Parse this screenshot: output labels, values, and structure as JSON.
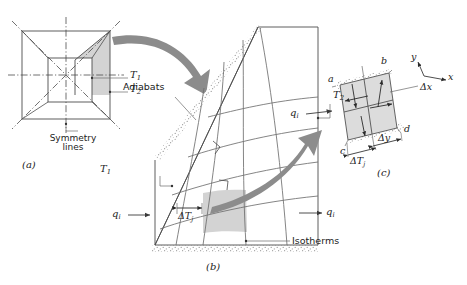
{
  "figure": {
    "kind": "heat-transfer-flux-plot",
    "panels": [
      {
        "id": "a",
        "caption": "(a)",
        "description": "Square channel cross section with symmetry lines and shaded symmetrical element"
      },
      {
        "id": "b",
        "caption": "(b)",
        "description": "Flux plot of symmetrical element showing adiabats and isotherms"
      },
      {
        "id": "c",
        "caption": "(c)",
        "description": "Typical curvilinear square with coordinate axes"
      }
    ]
  },
  "panel_a": {
    "caption": "(a)",
    "symmetry_label": {
      "line1": "Symmetry",
      "line2": "lines"
    },
    "temp_inner": "T",
    "temp_inner_sub": "1",
    "temp_outer": "T",
    "temp_outer_sub": "2"
  },
  "panel_b": {
    "caption": "(b)",
    "adiabats_label": "Adiabats",
    "isotherms_label": "Isotherms",
    "temp_hot": "T",
    "temp_hot_sub": "1",
    "temp_cold": "T",
    "temp_cold_sub": "2",
    "flux_left": "q",
    "flux_left_sub": "i",
    "flux_right": "q",
    "flux_right_sub": "i",
    "delta_t": "ΔT",
    "delta_t_sub": "j"
  },
  "panel_c": {
    "caption": "(c)",
    "corner_a": "a",
    "corner_b": "b",
    "corner_c": "c",
    "corner_d": "d",
    "axis_x": "x",
    "axis_y": "y",
    "delta_x": "Δx",
    "delta_y": "Δy",
    "delta_t": "ΔT",
    "delta_t_sub": "j",
    "flux_in": "q",
    "flux_in_sub": "i"
  },
  "colors": {
    "line": "#4d4d4d",
    "shade": "#d0d0d0",
    "arrow": "#8c8c8c",
    "stipple": "#9a9a9a",
    "text": "#222222",
    "background": "#ffffff"
  }
}
